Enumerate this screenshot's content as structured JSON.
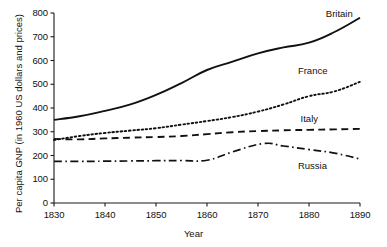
{
  "chart_data": {
    "type": "line",
    "title": "",
    "xlabel": "Year",
    "ylabel": "Per capita GNP (in 1960 US dollars and prices)",
    "xlim": [
      1830,
      1890
    ],
    "ylim": [
      0,
      800
    ],
    "grid": false,
    "legend_position": "inline-right-end-labels",
    "xticks": [
      "1830",
      "1840",
      "1850",
      "1860",
      "1870",
      "1880",
      "1890"
    ],
    "xtick_values": [
      1830,
      1840,
      1850,
      1860,
      1870,
      1880,
      1890
    ],
    "yticks": [
      "0",
      "100",
      "200",
      "300",
      "400",
      "500",
      "600",
      "700",
      "800"
    ],
    "ytick_values": [
      0,
      100,
      200,
      300,
      400,
      500,
      600,
      700,
      800
    ],
    "series": [
      {
        "name": "Britain",
        "style": "solid",
        "color": "#111111",
        "x": [
          1830,
          1835,
          1840,
          1845,
          1850,
          1855,
          1860,
          1865,
          1870,
          1875,
          1880,
          1885,
          1890
        ],
        "values": [
          350,
          365,
          388,
          415,
          455,
          505,
          560,
          595,
          630,
          655,
          675,
          720,
          780
        ]
      },
      {
        "name": "France",
        "style": "dotted",
        "color": "#111111",
        "x": [
          1830,
          1835,
          1840,
          1845,
          1850,
          1855,
          1860,
          1865,
          1870,
          1875,
          1880,
          1885,
          1890
        ],
        "values": [
          265,
          282,
          295,
          305,
          315,
          330,
          345,
          362,
          385,
          415,
          450,
          470,
          510
        ]
      },
      {
        "name": "Italy",
        "style": "dashed",
        "color": "#111111",
        "x": [
          1830,
          1835,
          1840,
          1845,
          1850,
          1855,
          1860,
          1865,
          1870,
          1875,
          1880,
          1885,
          1890
        ],
        "values": [
          270,
          268,
          272,
          275,
          278,
          282,
          290,
          298,
          303,
          306,
          308,
          310,
          312
        ]
      },
      {
        "name": "Russia",
        "style": "dash-dot",
        "color": "#111111",
        "x": [
          1830,
          1835,
          1840,
          1845,
          1850,
          1855,
          1860,
          1865,
          1871,
          1875,
          1880,
          1885,
          1890
        ],
        "values": [
          175,
          175,
          176,
          177,
          178,
          179,
          180,
          215,
          250,
          240,
          225,
          210,
          185
        ]
      }
    ],
    "series_labels": [
      {
        "name": "Britain",
        "x": 1887,
        "y": 795
      },
      {
        "name": "France",
        "x": 1881,
        "y": 555
      },
      {
        "name": "Italy",
        "x": 1881,
        "y": 355
      },
      {
        "name": "Russia",
        "x": 1881,
        "y": 155
      }
    ]
  }
}
